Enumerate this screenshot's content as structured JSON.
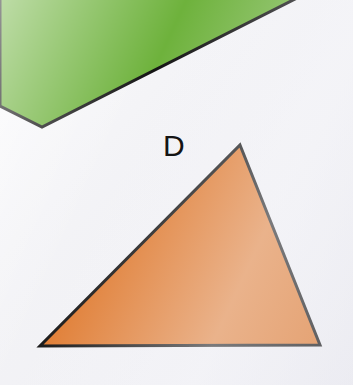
{
  "page": {
    "width": 353,
    "height": 385,
    "background_color": "#f2f2f5"
  },
  "colors": {
    "paper": "#f2f2f5",
    "green_fill": "#6eb23c",
    "orange_fill": "#e07b30",
    "outline": "#141414",
    "label_text": "#141414"
  },
  "shapes": [
    {
      "id": "green-quadrilateral",
      "name": "green-quadrilateral",
      "label": "",
      "fill_color": "#6eb23c",
      "stroke_color": "#141414",
      "stroke_width": 3,
      "cropped": true,
      "points": "0,-6 305,-6 42,127 0,106"
    },
    {
      "id": "orange-triangle",
      "name": "orange-triangle",
      "label": "D",
      "fill_color": "#e07b30",
      "stroke_color": "#141414",
      "stroke_width": 3,
      "cropped": false,
      "points": "240,145 320,345 40,346"
    }
  ],
  "labels": [
    {
      "name": "shape-label-d",
      "text": "D",
      "x": 163,
      "y": 131,
      "font_size": 30,
      "color": "#141414"
    }
  ]
}
